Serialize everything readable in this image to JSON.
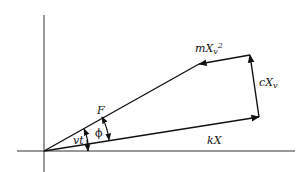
{
  "diagram": {
    "title": "",
    "colors": {
      "stroke": "#111111",
      "axis": "#333333",
      "background": "#ffffff"
    },
    "axes": {
      "origin": [
        44,
        151
      ],
      "vertical": {
        "x": 44,
        "y1": 15,
        "y2": 172
      },
      "horizontal": {
        "y": 151,
        "x1": 17,
        "x2": 295
      }
    },
    "vectors": [
      {
        "id": "F",
        "label": "F",
        "from": [
          44,
          151
        ],
        "to": [
          199,
          64
        ]
      },
      {
        "id": "mXv2",
        "label_main": "mX",
        "label_sub": "v",
        "label_sup": "2",
        "from": [
          250,
          55
        ],
        "to": [
          199,
          64
        ]
      },
      {
        "id": "cXv",
        "label_main": "cX",
        "label_sub": "v",
        "from": [
          259,
          117
        ],
        "to": [
          250,
          55
        ]
      },
      {
        "id": "kX",
        "label": "kX",
        "from": [
          44,
          151
        ],
        "to": [
          259,
          117
        ]
      }
    ],
    "angles": [
      {
        "id": "vt",
        "label": "vt",
        "between": [
          "x-axis",
          "F"
        ]
      },
      {
        "id": "phi",
        "label": "ϕ",
        "between": [
          "kX",
          "F"
        ]
      }
    ],
    "labels": {
      "F": "F",
      "mXv2_main": "mX",
      "mXv2_sub": "v",
      "mXv2_sup": "2",
      "cXv_main": "cX",
      "cXv_sub": "v",
      "kX": "kX",
      "vt": "vt",
      "phi": "ϕ"
    }
  }
}
